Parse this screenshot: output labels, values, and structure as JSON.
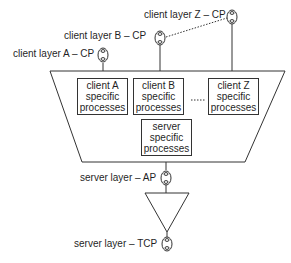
{
  "diagram": {
    "connection_points": {
      "client_a": "client layer A – CP",
      "client_b": "client layer B – CP",
      "client_z": "client layer Z – CP",
      "server_ap": "server layer – AP",
      "server_tcp": "server layer – TCP"
    },
    "boxes": {
      "client_a": {
        "line1": "client A",
        "line2": "specific",
        "line3": "processes"
      },
      "client_b": {
        "line1": "client B",
        "line2": "specific",
        "line3": "processes"
      },
      "client_z": {
        "line1": "client Z",
        "line2": "specific",
        "line3": "processes"
      },
      "server": {
        "line1": "server",
        "line2": "specific",
        "line3": "processes"
      }
    },
    "colors": {
      "line": "#333333",
      "background": "#ffffff",
      "text": "#1f1f1f"
    }
  }
}
